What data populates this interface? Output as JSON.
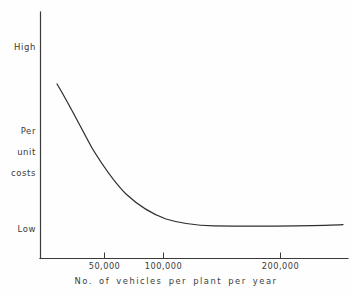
{
  "chart_data": {
    "type": "line",
    "title": "",
    "subtitle": "",
    "xlabel": "No.  of  vehicles  per  plant  per  year",
    "ylabel": "Per\nunit\ncosts",
    "grid": false,
    "legend": "none",
    "xlim": [
      14000,
      245000
    ],
    "ylim": [
      0,
      100
    ],
    "x_tick_labels": [
      "50,000",
      "100,000",
      "200,000"
    ],
    "x_tick_values": [
      50000,
      100000,
      200000
    ],
    "y_tick_labels": [
      "High",
      "Low"
    ],
    "y_axis_labels": {
      "high": "High",
      "low": "Low",
      "mid_line1": "Per",
      "mid_line2": "unit",
      "mid_line3": "costs"
    },
    "series": [
      {
        "name": "Per unit costs",
        "x": [
          18000,
          25000,
          32000,
          40000,
          50000,
          60000,
          72000,
          85000,
          100000,
          115000,
          130000,
          145000,
          160000,
          180000,
          200000,
          220000,
          240000
        ],
        "values": [
          82,
          71,
          61,
          52,
          44,
          37,
          31,
          26,
          22,
          18,
          15,
          13,
          12,
          11,
          10.5,
          10.5,
          11
        ]
      }
    ],
    "annotations": [],
    "colors": {
      "curve": "#2e2e2e",
      "axis": "#3a3a3a",
      "text": "#3b3b3b",
      "background": "#fefefe"
    }
  },
  "axes": {
    "x_caption": "No.  of  vehicles  per  plant  per  year"
  }
}
